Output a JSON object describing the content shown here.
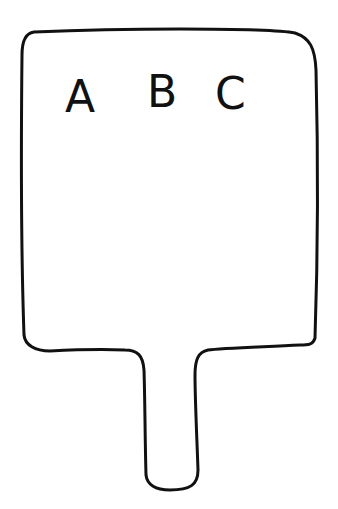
{
  "illustration": {
    "subject": "hornbook paddle",
    "letters": [
      "A",
      "B",
      "C"
    ],
    "stroke_color": "#111111",
    "background_color": "#ffffff"
  }
}
